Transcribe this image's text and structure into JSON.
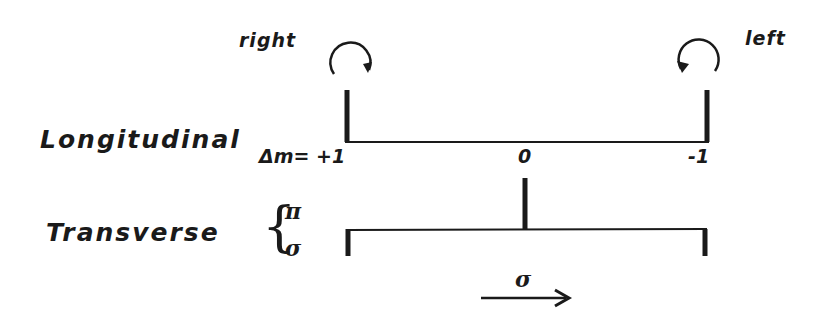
{
  "diagram": {
    "type": "zeeman-effect-level-diagram",
    "circular_polarization": {
      "right_label": "right",
      "left_label": "left"
    },
    "longitudinal": {
      "label": "Longitudinal",
      "delta_m_prefix": "Δm=",
      "ticks": [
        "+1",
        "0",
        "-1"
      ]
    },
    "transverse": {
      "label": "Transverse",
      "brace": "{",
      "pi_label": "π",
      "sigma_label": "σ"
    },
    "arrow": {
      "label": "σ",
      "direction": "right"
    },
    "colors": {
      "ink": "#1a1a1a",
      "background": "#ffffff"
    }
  }
}
